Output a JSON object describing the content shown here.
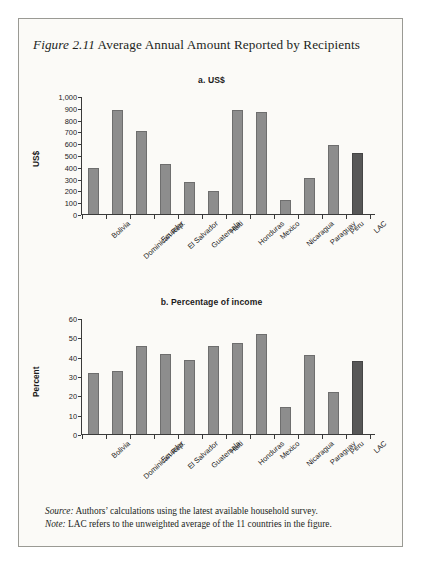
{
  "figure": {
    "number_label": "Figure 2.11",
    "title": "Average Annual Amount Reported by Recipients"
  },
  "footer": {
    "source_label": "Source:",
    "source_text": "Authors’ calculations using the latest available household survey.",
    "note_label": "Note:",
    "note_text": "LAC refers to the unweighted average of the 11 countries in the figure."
  },
  "colors": {
    "bar": "#8d8d8d",
    "bar_highlight": "#575757",
    "axis": "#3a3a3a",
    "page_background": "#fbfaf7",
    "border": "#9a9a94"
  },
  "chart_data": [
    {
      "type": "bar",
      "id": "panel-a",
      "title": "a. US$",
      "xlabel": "",
      "ylabel": "US$",
      "ylim": [
        0,
        1000
      ],
      "yticks": [
        0,
        100,
        200,
        300,
        400,
        500,
        600,
        700,
        800,
        900,
        1000
      ],
      "ytick_labels": [
        "0",
        "100",
        "200",
        "300",
        "400",
        "500",
        "600",
        "700",
        "800",
        "900",
        "1,000"
      ],
      "grid": false,
      "legend": "none",
      "highlight_category": "LAC",
      "categories": [
        "Bolivia",
        "Dominican Rep.",
        "Ecuador",
        "El Salvador",
        "Guatemala",
        "Haiti",
        "Honduras",
        "Mexico",
        "Nicaragua",
        "Paraguay",
        "Peru",
        "LAC"
      ],
      "values": [
        390,
        890,
        710,
        425,
        275,
        195,
        890,
        875,
        120,
        305,
        590,
        520
      ]
    },
    {
      "type": "bar",
      "id": "panel-b",
      "title": "b. Percentage of income",
      "xlabel": "",
      "ylabel": "Percent",
      "ylim": [
        0,
        60
      ],
      "yticks": [
        0,
        10,
        20,
        30,
        40,
        50,
        60
      ],
      "ytick_labels": [
        "0",
        "10",
        "20",
        "30",
        "40",
        "50",
        "60"
      ],
      "grid": false,
      "legend": "none",
      "highlight_category": "LAC",
      "categories": [
        "Bolivia",
        "Dominican Rep.",
        "Ecuador",
        "El Salvador",
        "Guatemala",
        "Haiti",
        "Honduras",
        "Mexico",
        "Nicaragua",
        "Paraguay",
        "Peru",
        "LAC"
      ],
      "values": [
        32,
        33,
        46,
        42,
        38.5,
        46,
        47.5,
        52,
        14,
        41,
        22,
        38
      ]
    }
  ]
}
